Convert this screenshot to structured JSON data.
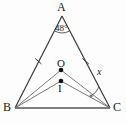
{
  "figure": {
    "type": "geometry-diagram",
    "stroke_color": "#3a3a3a",
    "label_color": "#1a1a1a",
    "background_color": "#fdfdfd"
  },
  "labels": {
    "apex": "A",
    "bottom_left": "B",
    "bottom_right": "C",
    "center_upper": "O",
    "center_lower": "I",
    "apex_angle": "48°",
    "unknown_angle": "x"
  },
  "geometry": {
    "points": {
      "A": {
        "x": 62,
        "y": 16
      },
      "B": {
        "x": 15,
        "y": 108
      },
      "C": {
        "x": 110,
        "y": 108
      },
      "O": {
        "x": 61,
        "y": 70
      },
      "I": {
        "x": 61,
        "y": 81
      }
    },
    "segments": [
      {
        "name": "AB",
        "from": "A",
        "to": "B"
      },
      {
        "name": "AC",
        "from": "A",
        "to": "C"
      },
      {
        "name": "BC",
        "from": "B",
        "to": "C"
      },
      {
        "name": "BO",
        "from": "B",
        "to": "O"
      },
      {
        "name": "OC",
        "from": "O",
        "to": "C"
      },
      {
        "name": "BI",
        "from": "B",
        "to": "I"
      },
      {
        "name": "IC",
        "from": "I",
        "to": "C"
      }
    ],
    "tick_marks": [
      {
        "on": "AB",
        "count": 1
      },
      {
        "on": "AC",
        "count": 1
      }
    ],
    "angle_arcs": [
      {
        "at": "A",
        "label": "48°"
      },
      {
        "at": "C",
        "label": "x"
      }
    ],
    "dots": [
      "O",
      "I"
    ]
  }
}
